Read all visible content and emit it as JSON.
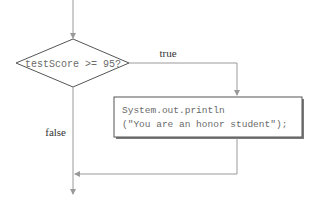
{
  "diagram": {
    "type": "flowchart",
    "decision": {
      "label": "testScore >= 95?"
    },
    "action": {
      "line1": "System.out.println",
      "line2": "(\"You are an honor student\");"
    },
    "branches": {
      "true_label": "true",
      "false_label": "false"
    },
    "colors": {
      "line": "#9a9a9a",
      "shape_stroke": "#555555",
      "text": "#6a6a6a",
      "label_text": "#333333",
      "box_shadow": "#7a7a7a"
    }
  }
}
